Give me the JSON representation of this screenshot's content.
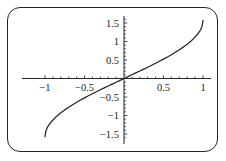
{
  "chart_data": {
    "type": "line",
    "title": "",
    "subtitle": "",
    "xlabel": "",
    "ylabel": "",
    "function": "arcsin(x)",
    "xlim": [
      -1.08,
      1.08
    ],
    "ylim": [
      -1.72,
      1.72
    ],
    "grid": false,
    "legend": null,
    "axes_cross_at_origin": true,
    "xticks": [
      -1,
      -0.5,
      0.5,
      1
    ],
    "xtick_labels": [
      "-1",
      "-0.5",
      "0.5",
      "1"
    ],
    "yticks": [
      -1.5,
      -1,
      -0.5,
      0.5,
      1,
      1.5
    ],
    "ytick_labels": [
      "-1.5",
      "-1",
      "-0.5",
      "0.5",
      "1",
      "1.5"
    ],
    "x": [
      -1.0,
      -0.99,
      -0.97,
      -0.95,
      -0.92,
      -0.88,
      -0.84,
      -0.8,
      -0.75,
      -0.7,
      -0.65,
      -0.6,
      -0.55,
      -0.5,
      -0.45,
      -0.4,
      -0.35,
      -0.3,
      -0.25,
      -0.2,
      -0.15,
      -0.1,
      -0.05,
      0.0,
      0.05,
      0.1,
      0.15,
      0.2,
      0.25,
      0.3,
      0.35,
      0.4,
      0.45,
      0.5,
      0.55,
      0.6,
      0.65,
      0.7,
      0.75,
      0.8,
      0.84,
      0.88,
      0.92,
      0.95,
      0.97,
      0.99,
      1.0
    ],
    "values": [
      -1.5708,
      -1.4289,
      -1.3181,
      -1.2532,
      -1.1681,
      -1.0759,
      -0.9973,
      -0.9273,
      -0.8481,
      -0.7754,
      -0.7076,
      -0.6435,
      -0.5824,
      -0.5236,
      -0.4668,
      -0.4115,
      -0.3576,
      -0.3047,
      -0.2527,
      -0.2014,
      -0.1506,
      -0.1002,
      -0.05,
      0.0,
      0.05,
      0.1002,
      0.1506,
      0.2014,
      0.2527,
      0.3047,
      0.3576,
      0.4115,
      0.4668,
      0.5236,
      0.5824,
      0.6435,
      0.7076,
      0.7754,
      0.8481,
      0.9273,
      0.9973,
      1.0759,
      1.1681,
      1.2532,
      1.3181,
      1.4289,
      1.5708
    ],
    "series": [
      {
        "name": "arcsin(x)",
        "color": "#232323",
        "values": [
          -1.5708,
          -1.4289,
          -1.3181,
          -1.2532,
          -1.1681,
          -1.0759,
          -0.9973,
          -0.9273,
          -0.8481,
          -0.7754,
          -0.7076,
          -0.6435,
          -0.5824,
          -0.5236,
          -0.4668,
          -0.4115,
          -0.3576,
          -0.3047,
          -0.2527,
          -0.2014,
          -0.1506,
          -0.1002,
          -0.05,
          0.0,
          0.05,
          0.1002,
          0.1506,
          0.2014,
          0.2527,
          0.3047,
          0.3576,
          0.4115,
          0.4668,
          0.5236,
          0.5824,
          0.6435,
          0.7076,
          0.7754,
          0.8481,
          0.9273,
          0.9973,
          1.0759,
          1.1681,
          1.2532,
          1.3181,
          1.4289,
          1.5708
        ]
      }
    ],
    "endpoints": {
      "left": [
        -1,
        -1.5708
      ],
      "right": [
        1,
        1.5708
      ]
    }
  },
  "figure": {
    "border_color": "#262626",
    "background_color": "#ffffff",
    "axis_color": "#2b2b2b",
    "curve_color": "#232323"
  },
  "geometry": {
    "origin_px": [
      124,
      78.5
    ],
    "x_unit_px": 79,
    "y_unit_px": 37
  }
}
